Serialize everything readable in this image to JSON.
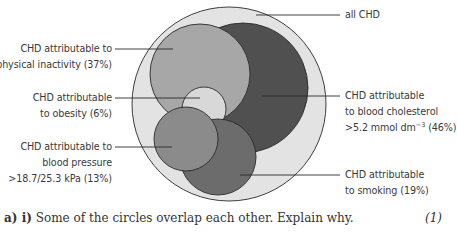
{
  "diagram": {
    "title": "",
    "circles": [
      {
        "id": "all-chd",
        "label": "all CHD",
        "cx": 229,
        "cy": 104,
        "r": 97,
        "fill": "#e3e3e3"
      },
      {
        "id": "cholesterol",
        "label": "CHD attributable to blood cholesterol >5.2 mmol dm-3 (46%)",
        "cx": 243,
        "cy": 88,
        "r": 65,
        "fill": "#505050"
      },
      {
        "id": "physical-inactivity",
        "label": "CHD attributable to physical inactivity (37%)",
        "cx": 200,
        "cy": 74,
        "r": 50,
        "fill": "#a7a7a7"
      },
      {
        "id": "obesity",
        "label": "CHD attributable to obesity (6%)",
        "cx": 204,
        "cy": 109,
        "r": 22,
        "fill": "#d8d8d8"
      },
      {
        "id": "smoking",
        "label": "CHD attributable to smoking (19%)",
        "cx": 218,
        "cy": 157,
        "r": 38,
        "fill": "#6c6c6c"
      },
      {
        "id": "blood-pressure",
        "label": "CHD attributable to blood pressure >18.7/25.3 kPa (13%)",
        "cx": 186,
        "cy": 139,
        "r": 32,
        "fill": "#8b8b8b"
      }
    ],
    "labels": {
      "all_chd": "all CHD",
      "physical_inactivity": {
        "line1": "CHD attributable to",
        "line2": "physical inactivity (37%)"
      },
      "obesity": {
        "line1": "CHD attributable",
        "line2": "to obesity (6%)"
      },
      "blood_pressure": {
        "line1": "CHD attributable to",
        "line2": "blood pressure",
        "line3": ">18.7/25.3 kPa (13%)"
      },
      "cholesterol": {
        "line1": "CHD attributable",
        "line2": "to blood cholesterol",
        "line3_prefix": ">5.2 mmol dm",
        "line3_sup": "−3",
        "line3_suffix": " (46%)"
      },
      "smoking": {
        "line1": "CHD attributable",
        "line2": "to smoking (19%)"
      }
    },
    "percentages": {
      "physical_inactivity": "37%",
      "obesity": "6%",
      "blood_pressure": "13%",
      "cholesterol": "46%",
      "smoking": "19%"
    }
  },
  "question": {
    "part": "a) i)",
    "text": "Some of the circles overlap each other. Explain why.",
    "marks": "(1)"
  }
}
